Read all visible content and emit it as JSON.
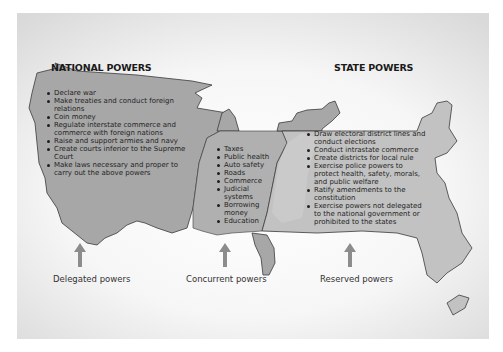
{
  "diagram": {
    "colors": {
      "national_fill": "#a7a7a7",
      "concurrent_fill": "#b6b6b6",
      "state_fill": "#c4c4c4",
      "outline": "#3a3a3a",
      "arrow": "#8c8c8c",
      "text": "#1f1f1f"
    },
    "national": {
      "heading": "NATIONAL POWERS",
      "items": [
        "Declare war",
        "Make treaties and conduct foreign relations",
        "Coin money",
        "Regulate interstate commerce and commerce with foreign nations",
        "Raise and support armies and navy",
        "Create courts inferior to the Supreme Court",
        "Make laws necessary and proper to carry out the above powers"
      ]
    },
    "concurrent": {
      "items": [
        "Taxes",
        "Public health",
        "Auto safety",
        "Roads",
        "Commerce",
        "Judicial systems",
        "Borrowing money",
        "Education"
      ]
    },
    "state": {
      "heading": "STATE POWERS",
      "items": [
        "Draw electoral district lines and conduct  elections",
        "Conduct intrastate commerce",
        "Create districts for local rule",
        "Exercise police powers to protect health, safety, morals, and public welfare",
        "Ratify amendments to the constitution",
        "Exercise powers not delegated to the national government or prohibited to the states"
      ]
    },
    "captions": {
      "delegated": "Delegated powers",
      "concurrent": "Concurrent powers",
      "reserved": "Reserved powers"
    },
    "icons": {
      "arrow": "up-arrow-icon"
    }
  }
}
